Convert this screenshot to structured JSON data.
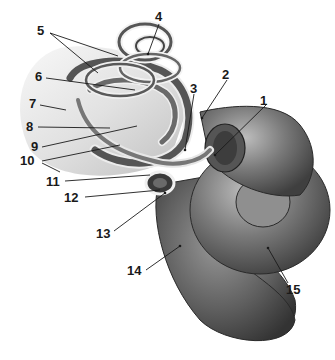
{
  "diagram": {
    "style": "grayscale anatomical illustration",
    "colors": {
      "background": "#ffffff",
      "structure_dark": "#3a3a3a",
      "structure_mid": "#6e6e6e",
      "structure_light": "#b5b5b5",
      "label_text": "#1a1a1a"
    },
    "labels": [
      {
        "id": "1",
        "text": "1",
        "x": 260,
        "y": 94
      },
      {
        "id": "2",
        "text": "2",
        "x": 222,
        "y": 70
      },
      {
        "id": "3",
        "text": "3",
        "x": 190,
        "y": 82
      },
      {
        "id": "4",
        "text": "4",
        "x": 155,
        "y": 12
      },
      {
        "id": "5",
        "text": "5",
        "x": 37,
        "y": 26
      },
      {
        "id": "6",
        "text": "6",
        "x": 36,
        "y": 70
      },
      {
        "id": "7",
        "text": "7",
        "x": 28,
        "y": 97
      },
      {
        "id": "8",
        "text": "8",
        "x": 26,
        "y": 120
      },
      {
        "id": "9",
        "text": "9",
        "x": 31,
        "y": 140
      },
      {
        "id": "10",
        "text": "10",
        "x": 21,
        "y": 154
      },
      {
        "id": "11",
        "text": "11",
        "x": 46,
        "y": 175
      },
      {
        "id": "12",
        "text": "12",
        "x": 64,
        "y": 191
      },
      {
        "id": "13",
        "text": "13",
        "x": 95,
        "y": 227
      },
      {
        "id": "14",
        "text": "14",
        "x": 127,
        "y": 265
      },
      {
        "id": "15",
        "text": "15",
        "x": 285,
        "y": 283
      }
    ]
  }
}
